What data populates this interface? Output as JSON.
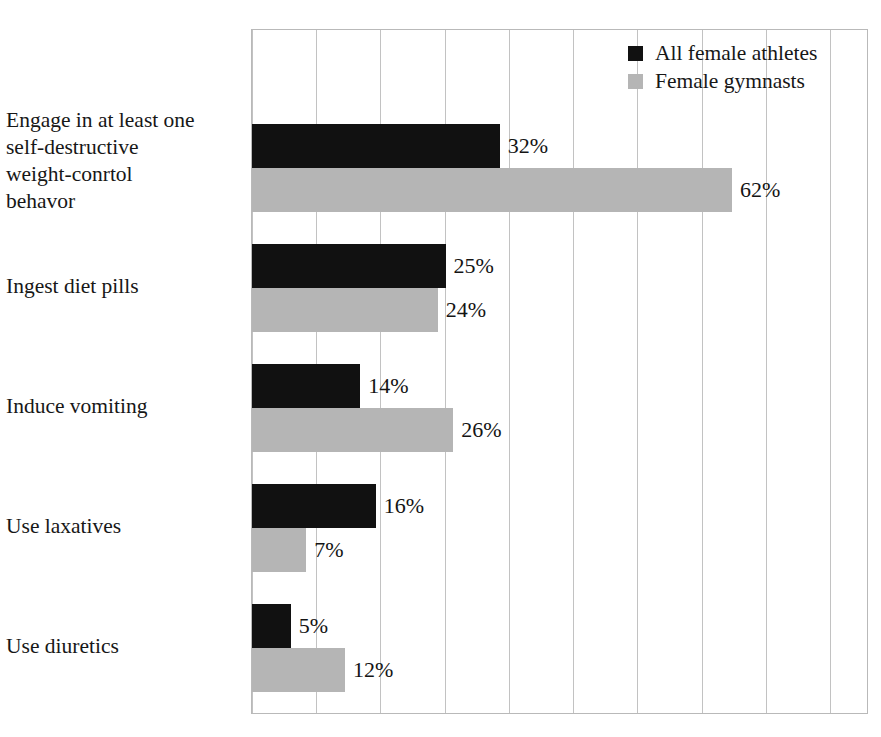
{
  "chart_data": {
    "type": "bar",
    "orientation": "horizontal",
    "title": "",
    "xlabel": "",
    "ylabel": "",
    "xlim": [
      0,
      80
    ],
    "grid": true,
    "grid_axis": "x",
    "xticks": [
      0,
      8.3,
      16.6,
      24.9,
      33.2,
      41.5,
      49.8,
      58.1,
      66.4,
      74.7
    ],
    "xticklabels": [],
    "legend_position": "top-right",
    "value_label_suffix": "%",
    "categories": [
      "Engage in at least one\nself-destructive\nweight-conrtol\nbehavor",
      "Ingest diet pills",
      "Induce vomiting",
      "Use laxatives",
      "Use diuretics"
    ],
    "series": [
      {
        "name": "All female athletes",
        "color": "#111111",
        "values": [
          32,
          25,
          14,
          16,
          5
        ],
        "value_labels": [
          "32%",
          "25%",
          "14%",
          "16%",
          "5%"
        ]
      },
      {
        "name": "Female gymnasts",
        "color": "#b5b5b5",
        "values": [
          62,
          24,
          26,
          7,
          12
        ],
        "value_labels": [
          "62%",
          "24%",
          "26%",
          "7%",
          "12%"
        ]
      }
    ]
  },
  "legend": {
    "items": [
      {
        "label": "All female athletes",
        "color": "#111111"
      },
      {
        "label": "Female gymnasts",
        "color": "#b5b5b5"
      }
    ]
  }
}
